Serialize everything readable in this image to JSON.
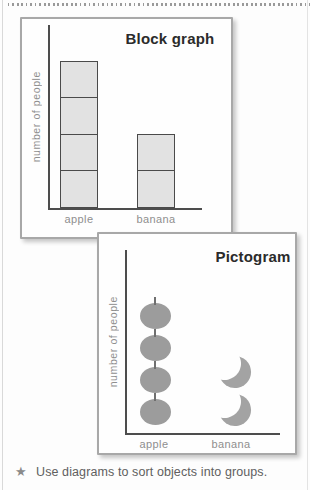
{
  "colors": {
    "card_border": "#a8a8a8",
    "axis": "#4d4d4d",
    "block_fill": "#e2e2e2",
    "block_border": "#4a4a4a",
    "icon_gray": "#9c9c9c",
    "label_gray": "#8f8f8f",
    "title_dark": "#2b2b2b",
    "note_text": "#606060"
  },
  "block_graph": {
    "title": "Block graph",
    "ylabel": "number of people",
    "categories": [
      "apple",
      "banana"
    ],
    "values": [
      4,
      2
    ]
  },
  "pictogram": {
    "title": "Pictogram",
    "ylabel": "number of people",
    "categories": [
      "apple",
      "banana"
    ],
    "values": [
      4,
      2
    ],
    "symbols": [
      "apple-icon",
      "banana-icon"
    ]
  },
  "note": {
    "bullet": "★",
    "text": "Use diagrams to sort objects into groups."
  },
  "chart_data": [
    {
      "type": "bar",
      "style": "block-graph",
      "title": "Block graph",
      "xlabel": "",
      "ylabel": "number of people",
      "categories": [
        "apple",
        "banana"
      ],
      "values": [
        4,
        2
      ],
      "ylim": [
        0,
        4
      ],
      "unit": "1 block = 1 person",
      "grid": false,
      "legend": false
    },
    {
      "type": "bar",
      "style": "pictogram",
      "title": "Pictogram",
      "xlabel": "",
      "ylabel": "number of people",
      "categories": [
        "apple",
        "banana"
      ],
      "values": [
        4,
        2
      ],
      "symbols": [
        "apple",
        "banana"
      ],
      "unit": "1 symbol = 1 person",
      "grid": false,
      "legend": false
    }
  ]
}
